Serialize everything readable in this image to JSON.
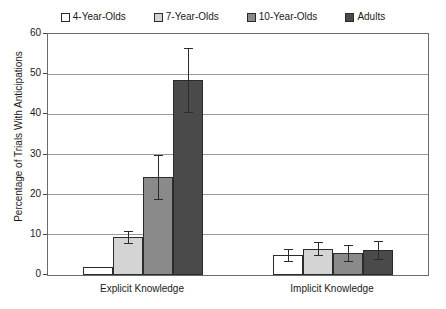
{
  "chart_data": {
    "type": "bar",
    "title": "",
    "subtitle": "",
    "xlabel": "",
    "ylabel": "Percentage of Trials With Anticipations",
    "categories": [
      "Explicit Knowledge",
      "Implicit Knowledge"
    ],
    "ylim": [
      0,
      60
    ],
    "yticks": [
      0,
      10,
      20,
      30,
      40,
      50,
      60
    ],
    "ytick_labels": [
      "0",
      "10",
      "20",
      "30",
      "40",
      "50",
      "60"
    ],
    "grid": true,
    "legend_position": "top-center",
    "error_bars": "standard error",
    "series": [
      {
        "name": "4-Year-Olds",
        "color": "#ffffff",
        "values": [
          2.0,
          5.0
        ],
        "errors": [
          0.0,
          1.5
        ]
      },
      {
        "name": "7-Year-Olds",
        "color": "#d4d4d4",
        "values": [
          9.5,
          6.5
        ],
        "errors": [
          1.5,
          1.6
        ]
      },
      {
        "name": "10-Year-Olds",
        "color": "#8a8a8a",
        "values": [
          24.5,
          5.5
        ],
        "errors": [
          5.5,
          2.0
        ]
      },
      {
        "name": "Adults",
        "color": "#4a4a4a",
        "values": [
          48.5,
          6.3
        ],
        "errors": [
          8.0,
          2.2
        ]
      }
    ]
  },
  "legend": {
    "entries": [
      {
        "label": "4-Year-Olds",
        "color": "#ffffff"
      },
      {
        "label": "7-Year-Olds",
        "color": "#d4d4d4"
      },
      {
        "label": "10-Year-Olds",
        "color": "#8a8a8a"
      },
      {
        "label": "Adults",
        "color": "#4a4a4a"
      }
    ]
  },
  "axes": {
    "y_title": "Percentage of Trials With Anticipations",
    "y_tick_labels": [
      "60",
      "50",
      "40",
      "30",
      "20",
      "10",
      "0"
    ],
    "x_tick_labels": [
      "Explicit Knowledge",
      "Implicit Knowledge"
    ]
  },
  "colors": {
    "axis": "#6b6b6b",
    "grid": "#9a9a9a",
    "bar_outline": "#2b2b2b",
    "text": "#1a1a1a",
    "background": "#ffffff"
  }
}
